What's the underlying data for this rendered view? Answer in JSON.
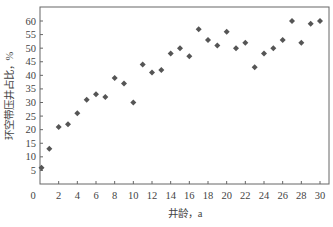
{
  "chart_data": {
    "type": "scatter",
    "title": "",
    "xlabel": "井龄，a",
    "ylabel": "环空带压井占比，%",
    "xlim": [
      0,
      30
    ],
    "ylim": [
      0,
      65
    ],
    "xticks": [
      0,
      2,
      4,
      6,
      8,
      10,
      12,
      14,
      16,
      18,
      20,
      22,
      24,
      26,
      28,
      30
    ],
    "yticks": [
      5,
      10,
      15,
      20,
      25,
      30,
      35,
      40,
      45,
      50,
      55,
      60
    ],
    "grid": false,
    "legend": null,
    "marker": "diamond",
    "marker_color": "#555555",
    "series": [
      {
        "name": "环空带压井占比",
        "x": [
          0,
          1,
          2,
          3,
          4,
          5,
          6,
          7,
          8,
          9,
          10,
          11,
          12,
          13,
          14,
          15,
          16,
          17,
          18,
          19,
          20,
          21,
          22,
          23,
          24,
          25,
          26,
          27,
          28,
          29,
          30
        ],
        "y": [
          6,
          13,
          21,
          22,
          26,
          31,
          33,
          32,
          39,
          37,
          30,
          44,
          41,
          42,
          48,
          50,
          47,
          57,
          53,
          51,
          56,
          50,
          52,
          43,
          48,
          50,
          53,
          60,
          52,
          59,
          60
        ]
      }
    ]
  }
}
